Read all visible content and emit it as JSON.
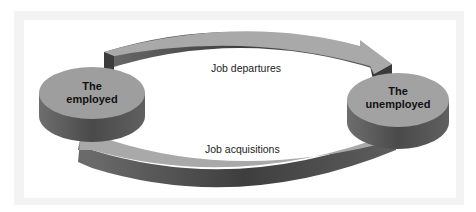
{
  "diagram": {
    "type": "cycle",
    "nodes": [
      {
        "id": "employed",
        "label_line1": "The",
        "label_line2": "employed"
      },
      {
        "id": "unemployed",
        "label_line1": "The",
        "label_line2": "unemployed"
      }
    ],
    "edges": [
      {
        "from": "employed",
        "to": "unemployed",
        "label": "Job departures",
        "position": "top"
      },
      {
        "from": "unemployed",
        "to": "employed",
        "label": "Job acquisitions",
        "position": "bottom"
      }
    ],
    "colors": {
      "disk_top": "#9e9e9e",
      "disk_side": "#5a5a5a",
      "arrow_top": "#a8a8a8",
      "arrow_side": "#4a4a4a",
      "frame": "#f3f3f3"
    }
  }
}
